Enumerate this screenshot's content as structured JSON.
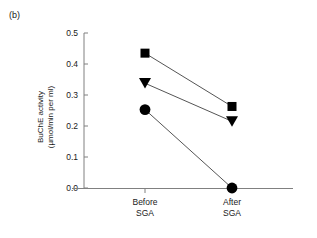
{
  "figure": {
    "panel_label": "(b)"
  },
  "chart_data": {
    "type": "line",
    "title": "",
    "subtitle": "",
    "xlabel": "",
    "ylabel": "BuChE activity (µmol/min per ml)",
    "ylabel_line1": "BuChE activity",
    "ylabel_line2": "(µmol/min per ml)",
    "categories": [
      "Before SGA",
      "After SGA"
    ],
    "category_lines": [
      {
        "line1": "Before",
        "line2": "SGA"
      },
      {
        "line1": "After",
        "line2": "SGA"
      }
    ],
    "ylim": [
      0.0,
      0.5
    ],
    "ytick_labels": [
      "0.0",
      "0.1",
      "0.2",
      "0.3",
      "0.4",
      "0.5"
    ],
    "ytick_values": [
      0.0,
      0.1,
      0.2,
      0.3,
      0.4,
      0.5
    ],
    "grid": false,
    "legend": "none",
    "series": [
      {
        "name": "subject-1",
        "marker": "square",
        "color": "#000000",
        "values": [
          0.435,
          0.263
        ]
      },
      {
        "name": "subject-2",
        "marker": "triangle-down",
        "color": "#000000",
        "values": [
          0.338,
          0.215
        ]
      },
      {
        "name": "subject-3",
        "marker": "circle",
        "color": "#000000",
        "values": [
          0.253,
          0.0
        ]
      }
    ],
    "axis_color": "#808080",
    "line_color": "#555555"
  }
}
